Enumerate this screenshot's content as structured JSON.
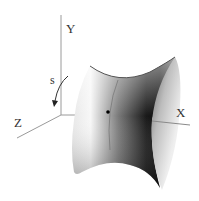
{
  "figure": {
    "axes": {
      "x_label": "X",
      "y_label": "Y",
      "z_label": "Z"
    },
    "parameter_label": "s",
    "surface": "saddle-shaped surface of revolution with marked point",
    "colors": {
      "axis": "#9a9a9a",
      "label": "#333333",
      "surface_dark": "#111111",
      "surface_light": "#ffffff",
      "point": "#000000"
    }
  }
}
